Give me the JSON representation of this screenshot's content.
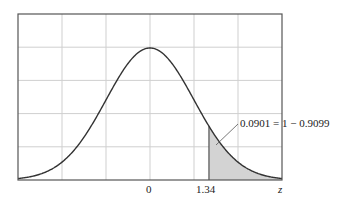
{
  "chart_data": {
    "type": "area",
    "title": "",
    "xlabel": "z",
    "ylabel": "",
    "distribution": "standard normal",
    "x_ticks_labeled": [
      "0",
      "1.34"
    ],
    "x_range": [
      -3.0,
      3.0
    ],
    "shaded_region": {
      "from": 1.34,
      "to": 3.0,
      "area": 0.0901
    },
    "annotation": "0.0901 = 1 − 0.9099",
    "grid": true,
    "grid_vertical_lines": 6,
    "grid_horizontal_lines": 5,
    "colors": {
      "curve": "#333333",
      "shade": "#d3d3d3",
      "grid": "#cfcfcf",
      "frame": "#555555"
    }
  },
  "labels": {
    "zero": "0",
    "z_value": "1.34",
    "axis_var": "z",
    "annotation": "0.0901 = 1 − 0.9099"
  }
}
